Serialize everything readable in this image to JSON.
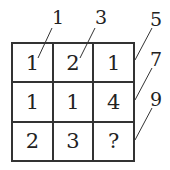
{
  "grid": {
    "rows": [
      [
        "1",
        "2",
        "1"
      ],
      [
        "1",
        "1",
        "4"
      ],
      [
        "2",
        "3",
        "?"
      ]
    ]
  },
  "labels": [
    "1",
    "3",
    "5",
    "7",
    "9"
  ]
}
